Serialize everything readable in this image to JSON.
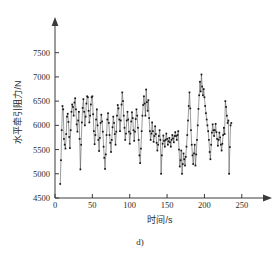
{
  "figure": {
    "caption": "d)",
    "background_color": "#ffffff",
    "line_color": "#4a4a4a",
    "marker_color": "#141414",
    "axis_color": "#3a3a3a"
  },
  "chart_data": {
    "type": "line",
    "title": "",
    "subtitle": "d)",
    "xlabel": "时间/s",
    "ylabel": "水平牵引阻力/N",
    "xlim": [
      0,
      265
    ],
    "ylim": [
      4500,
      7700
    ],
    "xticks": [
      0,
      50,
      100,
      150,
      200,
      250
    ],
    "xtick_labels": [
      "0",
      "50",
      "100",
      "150",
      "200",
      "250"
    ],
    "yticks": [
      4500,
      5000,
      5500,
      6000,
      6500,
      7000,
      7500
    ],
    "ytick_labels": [
      "4500",
      "5000",
      "5500",
      "6000",
      "6500",
      "7000",
      "7500"
    ],
    "grid": false,
    "legend": null,
    "marker": "dot",
    "axis_arrows": {
      "x": true,
      "y": true
    },
    "series": [
      {
        "name": "水平牵引阻力",
        "x": [
          7.0,
          8.0,
          9.0,
          10.0,
          11.0,
          12.0,
          13.0,
          14.0,
          15.0,
          16.0,
          17.0,
          18.0,
          19.0,
          20.0,
          21.0,
          22.0,
          23.0,
          24.0,
          25.0,
          26.0,
          27.0,
          28.0,
          29.0,
          30.0,
          31.0,
          32.0,
          33.0,
          34.0,
          35.0,
          36.0,
          37.0,
          38.0,
          39.0,
          40.0,
          41.0,
          42.0,
          43.0,
          44.0,
          45.0,
          46.0,
          47.0,
          48.0,
          49.0,
          50.0,
          51.0,
          52.0,
          53.0,
          54.0,
          55.0,
          56.0,
          57.0,
          58.0,
          59.0,
          60.0,
          61.0,
          62.0,
          63.0,
          64.0,
          65.0,
          66.0,
          67.0,
          68.0,
          69.0,
          70.0,
          71.0,
          72.0,
          73.0,
          74.0,
          75.0,
          76.0,
          77.0,
          78.0,
          79.0,
          80.0,
          81.0,
          82.0,
          83.0,
          84.0,
          85.0,
          86.0,
          87.0,
          88.0,
          89.0,
          90.0,
          91.0,
          92.0,
          93.0,
          94.0,
          95.0,
          96.0,
          97.0,
          98.0,
          99.0,
          100.0,
          101.0,
          102.0,
          103.0,
          104.0,
          105.0,
          106.0,
          107.0,
          108.0,
          109.0,
          110.0,
          111.0,
          112.0,
          113.0,
          114.0,
          115.0,
          116.0,
          117.0,
          118.0,
          119.0,
          120.0,
          121.0,
          122.0,
          123.0,
          124.0,
          125.0,
          126.0,
          127.0,
          128.0,
          129.0,
          130.0,
          131.0,
          132.0,
          133.0,
          134.0,
          135.0,
          136.0,
          137.0,
          138.0,
          139.0,
          140.0,
          141.0,
          142.0,
          143.0,
          144.0,
          145.0,
          146.0,
          147.0,
          148.0,
          149.0,
          150.0,
          151.0,
          152.0,
          153.0,
          154.0,
          155.0,
          156.0,
          157.0,
          158.0,
          159.0,
          160.0,
          161.0,
          162.0,
          163.0,
          164.0,
          165.0,
          166.0,
          167.0,
          168.0,
          169.0,
          170.0,
          171.0,
          172.0,
          173.0,
          174.0,
          175.0,
          176.0,
          177.0,
          178.0,
          179.0,
          180.0,
          181.0,
          182.0,
          183.0,
          184.0,
          185.0,
          186.0,
          187.0,
          188.0,
          189.0,
          190.0,
          191.0,
          192.0,
          193.0,
          194.0,
          195.0,
          196.0,
          197.0,
          198.0,
          199.0,
          200.0,
          201.0,
          202.0,
          203.0,
          204.0,
          205.0,
          206.0,
          207.0,
          208.0,
          209.0,
          210.0,
          211.0,
          212.0,
          213.0,
          214.0,
          215.0,
          216.0,
          217.0,
          218.0,
          219.0,
          220.0,
          221.0,
          222.0,
          223.0,
          224.0,
          225.0,
          226.0,
          227.0,
          228.0,
          229.0,
          230.0,
          231.0,
          232.0,
          233.0,
          234.0,
          235.0,
          236.0
        ],
        "values": [
          4790,
          5280,
          5900,
          6400,
          6330,
          5720,
          5600,
          5520,
          5820,
          6180,
          6240,
          6070,
          5760,
          5530,
          5900,
          6280,
          6430,
          6380,
          6200,
          6470,
          6560,
          6330,
          6020,
          5870,
          6100,
          6280,
          5720,
          5090,
          5600,
          6060,
          6360,
          6540,
          6280,
          6000,
          6180,
          6450,
          6600,
          6580,
          6300,
          6060,
          6200,
          6430,
          6580,
          6600,
          6230,
          5880,
          5610,
          5800,
          6120,
          6330,
          6000,
          5700,
          5470,
          5740,
          6050,
          6220,
          6080,
          5870,
          5560,
          5330,
          5100,
          5400,
          5800,
          6120,
          6250,
          6050,
          5800,
          5640,
          5450,
          5700,
          5960,
          6180,
          6050,
          5820,
          5600,
          5870,
          6200,
          6420,
          6350,
          6120,
          5880,
          6100,
          6430,
          6680,
          6500,
          6200,
          5950,
          5700,
          5830,
          6100,
          6280,
          6120,
          5870,
          5620,
          5830,
          6080,
          6270,
          6150,
          5900,
          5680,
          5870,
          6130,
          6330,
          6200,
          5950,
          5700,
          5380,
          5220,
          5520,
          5880,
          6200,
          6420,
          6600,
          6450,
          6200,
          6740,
          6480,
          6300,
          6520,
          6150,
          5880,
          5700,
          5830,
          6060,
          5880,
          5660,
          5780,
          5980,
          5820,
          5640,
          5480,
          5600,
          5780,
          5900,
          5700,
          5000,
          5380,
          5620,
          5790,
          5680,
          5560,
          5700,
          5830,
          5720,
          5600,
          5670,
          5740,
          5650,
          5560,
          5700,
          5800,
          5730,
          5650,
          5780,
          5860,
          5780,
          5700,
          5800,
          5880,
          5500,
          5150,
          5280,
          5480,
          5000,
          5200,
          5420,
          5300,
          5170,
          5350,
          5560,
          5800,
          6100,
          6400,
          6680,
          6350,
          5900,
          5600,
          5380,
          5200,
          5420,
          5600,
          5170,
          5400,
          5700,
          6000,
          6340,
          6620,
          6900,
          6700,
          7050,
          6800,
          6620,
          6750,
          6580,
          6400,
          6250,
          6120,
          6000,
          5880,
          5700,
          5450,
          5300,
          5600,
          5850,
          6020,
          5900,
          5780,
          5900,
          6030,
          5860,
          5720,
          5580,
          5700,
          5850,
          5750,
          5600,
          5480,
          5620,
          5800,
          5950,
          5820,
          6500,
          6380,
          6200,
          6050,
          6100,
          5000,
          5550,
          6000,
          6050
        ]
      }
    ]
  }
}
